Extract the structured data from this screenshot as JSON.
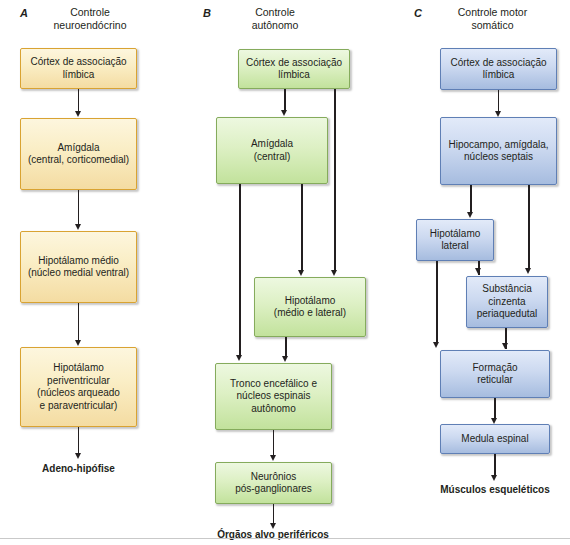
{
  "figure": {
    "footer_rule": "horizontal-rule"
  },
  "panels": [
    {
      "letter": "A",
      "title": "Controle\nneuroendócrino",
      "title_line1": "Controle",
      "title_line2": "neuroendócrino",
      "color": "#d9a332",
      "nodes": [
        {
          "id": "a1",
          "label": "Córtex de associação\nlímbica"
        },
        {
          "id": "a2",
          "label": "Amígdala\n(central, corticomedial)"
        },
        {
          "id": "a3",
          "label": "Hipotálamo médio\n(núcleo medial ventral)"
        },
        {
          "id": "a4",
          "label": "Hipotálamo\nperiventricular\n(núcleos arqueado\ne paraventricular)"
        }
      ],
      "terminal": "Adeno-hipófise"
    },
    {
      "letter": "B",
      "title": "Controle\nautônomo",
      "title_line1": "Controle",
      "title_line2": "autônomo",
      "color": "#85ab5c",
      "nodes": [
        {
          "id": "b1",
          "label": "Córtex de associação\nlímbica"
        },
        {
          "id": "b2",
          "label": "Amígdala\n(central)"
        },
        {
          "id": "b3",
          "label": "Hipotálamo\n(médio e lateral)"
        },
        {
          "id": "b4",
          "label": "Tronco encefálico e\nnúcleos espinais\nautônomo"
        },
        {
          "id": "b5",
          "label": "Neurônios\npós-ganglionares"
        }
      ],
      "terminal": "Órgãos alvo periféricos"
    },
    {
      "letter": "C",
      "title": "Controle motor\nsomático",
      "title_line1": "Controle motor",
      "title_line2": "somático",
      "color": "#5f7fb5",
      "nodes": [
        {
          "id": "c1",
          "label": "Córtex de associação\nlímbica"
        },
        {
          "id": "c2",
          "label": "Hipocampo, amígdala,\nnúcleos septais"
        },
        {
          "id": "c3",
          "label": "Hipotálamo\nlateral"
        },
        {
          "id": "c4",
          "label": "Substância\ncinzenta\nperiaquedutal"
        },
        {
          "id": "c5",
          "label": "Formação\nreticular"
        },
        {
          "id": "c6",
          "label": "Medula espinal"
        }
      ],
      "terminal": "Músculos esqueléticos"
    }
  ]
}
